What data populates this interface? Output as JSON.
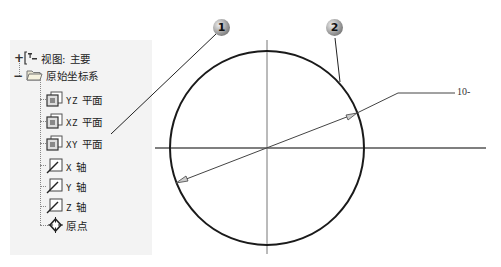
{
  "tree": {
    "view_item": {
      "expander": "+",
      "label": "视图: 主要"
    },
    "origin_folder": {
      "expander": "−",
      "label": "原始坐标系"
    },
    "planes": [
      {
        "axis": "YZ",
        "label": "平面"
      },
      {
        "axis": "XZ",
        "label": "平面"
      },
      {
        "axis": "XY",
        "label": "平面"
      }
    ],
    "axes": [
      {
        "axis": "X",
        "label": "轴"
      },
      {
        "axis": "Y",
        "label": "轴"
      },
      {
        "axis": "Z",
        "label": "轴"
      }
    ],
    "origin_point": {
      "label": "原点"
    }
  },
  "callouts": [
    {
      "number": "1"
    },
    {
      "number": "2"
    }
  ],
  "drawing": {
    "dimension_value": "10",
    "dimension_suffix": "-",
    "colors": {
      "line": "#1a1a1a",
      "axis": "#555555",
      "panel_bg": "#f3f3f3"
    }
  }
}
